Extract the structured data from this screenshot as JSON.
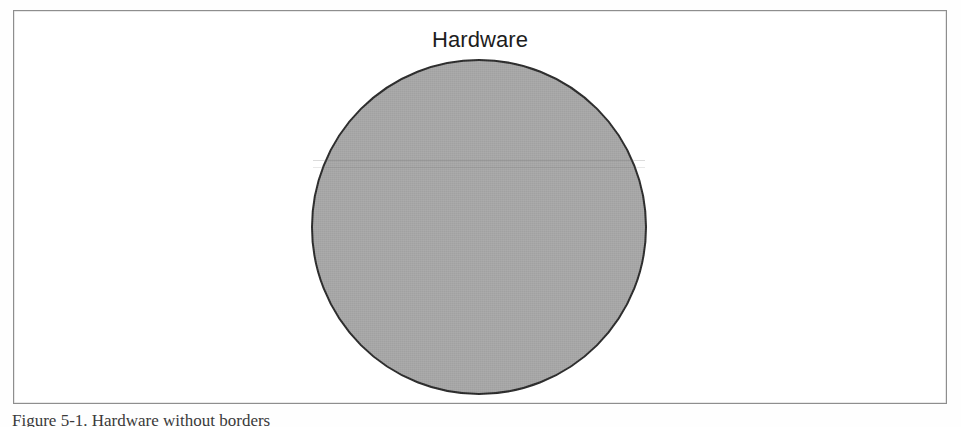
{
  "figure": {
    "frame_border_color": "#8e8e8e",
    "background_color": "#ffffff",
    "caption": "Figure 5-1. Hardware without borders"
  },
  "chart_data": {
    "type": "pie",
    "title": "Hardware",
    "subtitle": "",
    "xlabel": "",
    "ylabel": "",
    "grid": false,
    "legend_position": "none",
    "categories": [
      "Hardware"
    ],
    "values": [
      100
    ],
    "labels": [
      "Hardware"
    ],
    "annotations": [
      "Hardware"
    ],
    "colors": [
      "#a8a8a8"
    ],
    "outline_color": "#2b2b2b",
    "geometry": {
      "shape": "circle",
      "center_x": 477,
      "center_y": 226,
      "diameter": 336,
      "radius": 168
    }
  }
}
